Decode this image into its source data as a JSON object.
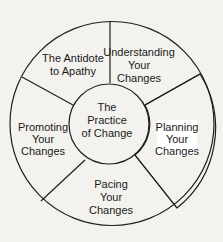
{
  "diagram": {
    "center": {
      "label": "The Practice of Change",
      "lines": [
        "The",
        "Practice",
        "of Change"
      ]
    },
    "segments": [
      {
        "id": "antidote",
        "lines": [
          "The Antidote",
          "to Apathy"
        ],
        "highlighted": false
      },
      {
        "id": "understanding",
        "lines": [
          "Understanding",
          "Your",
          "Changes"
        ],
        "highlighted": false
      },
      {
        "id": "planning",
        "lines": [
          "Planning",
          "Your",
          "Changes"
        ],
        "highlighted": true,
        "fill": "vertical-hatch"
      },
      {
        "id": "pacing",
        "lines": [
          "Pacing",
          "Your",
          "Changes"
        ],
        "highlighted": false
      },
      {
        "id": "promoting",
        "lines": [
          "Promoting",
          "Your",
          "Changes"
        ],
        "highlighted": false
      }
    ],
    "colors": {
      "line": "#1f1f1f",
      "background": "#f4f2ee",
      "segment_fill": "#ffffff",
      "hatch": "#1a1a1a"
    }
  }
}
